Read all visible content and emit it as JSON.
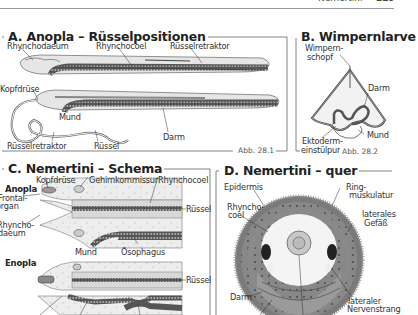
{
  "page_header": {
    "right_text": "Nemertini",
    "page_number": "229"
  },
  "panels": {
    "A": {
      "title": "A. Anopla – Rüsselpositionen",
      "figure": "Abb. 28.1",
      "labels": [
        "Rhynchodaeum",
        "Rhynchocoel",
        "Rüsselretraktor",
        "Kopfdrüse",
        "Mund",
        "Darm",
        "Rüsselretraktor",
        "Rüssel"
      ]
    },
    "B": {
      "title": "B. Wimpernlarve",
      "figure": "Abb. 28.2",
      "labels": [
        "Wimpern-",
        "schopf",
        "Darm",
        "Mund",
        "Ektoderm-",
        "einstülpung"
      ]
    },
    "C": {
      "title": "C. Nemertini – Schema",
      "groups": [
        "Anopla",
        "Enopla"
      ],
      "labels": [
        "Kopfdrüse",
        "Gehirnkommissur",
        "Rhynchocoel",
        "Frontal-",
        "organ",
        "Rüssel",
        "Rhyncho-",
        "daeum",
        "Mund",
        "Ösophagus",
        "Rüssel"
      ]
    },
    "D": {
      "title": "D. Nemertini – quer",
      "labels": [
        "Epidermis",
        "Ring-",
        "muskulatur",
        "Rhyncho-",
        "coel",
        "laterales",
        "Gefäß",
        "Darm",
        "lateraler",
        "Nervenstrang"
      ]
    }
  },
  "colors": {
    "frame": "#555555",
    "body_fill": "#e4e4e4",
    "gut_dark": "#4a4a4a",
    "ring_gray": "#9a9a9a",
    "text": "#222222"
  }
}
